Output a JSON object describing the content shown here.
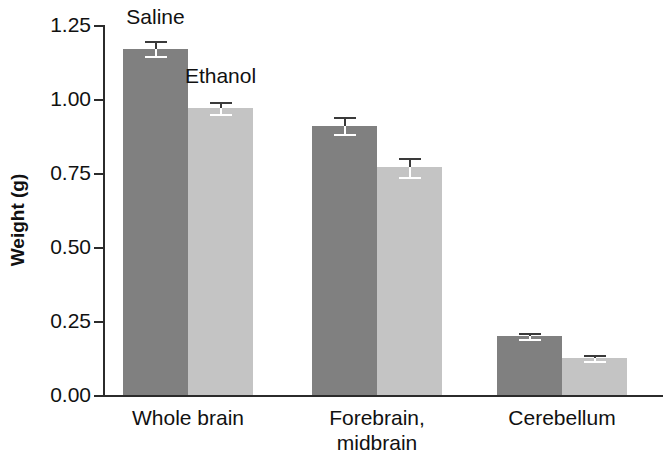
{
  "chart_data": {
    "type": "bar",
    "title": "",
    "xlabel": "",
    "ylabel": "Weight (g)",
    "ylim": [
      0.0,
      1.25
    ],
    "yticks": [
      "0.00",
      "0.25",
      "0.50",
      "0.75",
      "1.00",
      "1.25"
    ],
    "ytick_values": [
      0.0,
      0.25,
      0.5,
      0.75,
      1.0,
      1.25
    ],
    "grid": false,
    "legend_position": "inline-annotations",
    "categories": [
      "Whole brain",
      "Forebrain, midbrain",
      "Cerebellum"
    ],
    "category_lines": [
      [
        "Whole brain"
      ],
      [
        "Forebrain,",
        "midbrain"
      ],
      [
        "Cerebellum"
      ]
    ],
    "series": [
      {
        "name": "Saline",
        "color": "#808080",
        "values": [
          1.17,
          0.91,
          0.2
        ],
        "errors": [
          0.025,
          0.028,
          0.008
        ]
      },
      {
        "name": "Ethanol",
        "color": "#c4c4c4",
        "values": [
          0.97,
          0.77,
          0.125
        ],
        "errors": [
          0.02,
          0.032,
          0.006
        ]
      }
    ],
    "annotations": [
      {
        "text": "Saline",
        "series": "Saline"
      },
      {
        "text": "Ethanol",
        "series": "Ethanol"
      }
    ]
  },
  "axis": {
    "y_title": "Weight (g)",
    "y_ticks": [
      "1.25",
      "1.00",
      "0.75",
      "0.50",
      "0.25",
      "0.00"
    ]
  },
  "labels": {
    "cat1": "Whole brain",
    "cat2_line1": "Forebrain,",
    "cat2_line2": "midbrain",
    "cat3": "Cerebellum",
    "annot_saline": "Saline",
    "annot_ethanol": "Ethanol"
  },
  "colors": {
    "saline": "#808080",
    "ethanol": "#c4c4c4",
    "axis": "#2b2b2b",
    "background": "#ffffff"
  }
}
